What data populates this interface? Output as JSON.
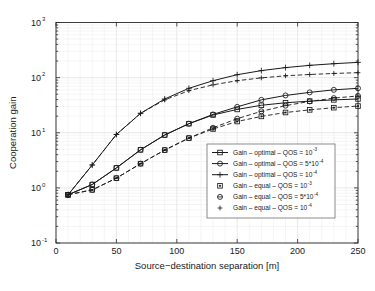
{
  "figure": {
    "background_color": "#ffffff",
    "line_color": "#1a1a1a",
    "grid_color": "#ebebeb"
  },
  "chart_data": {
    "type": "line",
    "title": "",
    "xlabel": "Source−destination separation [m]",
    "ylabel": "Cooperation gain",
    "xlim": [
      0,
      250
    ],
    "ylim": [
      0.1,
      1000
    ],
    "yscale": "log",
    "xscale": "linear",
    "grid": true,
    "xticks": [
      0,
      50,
      100,
      150,
      200,
      250
    ],
    "xticklabels": [
      "0",
      "50",
      "100",
      "150",
      "200",
      "250"
    ],
    "yticks": [
      0.1,
      1,
      10,
      100,
      1000
    ],
    "yticklabels": [
      "10^-1",
      "10^0",
      "10^1",
      "10^2",
      "10^3"
    ],
    "ytick_base": "10",
    "ytick_exponents": [
      "-1",
      "0",
      "1",
      "2",
      "3"
    ],
    "legend_position": "lower right",
    "x": [
      10,
      30,
      50,
      70,
      90,
      110,
      130,
      150,
      170,
      190,
      210,
      230,
      250
    ],
    "series": [
      {
        "name": "Gain - optimal - QOS = 10^-3",
        "label_main": "Gain – optimal – QOS = 10",
        "label_exp": "-3",
        "marker": "square",
        "linestyle": "solid",
        "values": [
          0.75,
          1.15,
          2.3,
          4.9,
          9.1,
          14.6,
          21.0,
          26.5,
          31.5,
          35.0,
          37.5,
          39.5,
          41.0
        ]
      },
      {
        "name": "Gain - optimal - QOS = 5*10^-4",
        "label_main": "Gain – optimal – QOS = 5*10",
        "label_exp": "-4",
        "marker": "circle",
        "linestyle": "solid",
        "values": [
          0.75,
          1.15,
          2.3,
          4.9,
          9.1,
          14.6,
          21.5,
          29.5,
          39.5,
          47.5,
          54.0,
          60.0,
          64.0
        ]
      },
      {
        "name": "Gain - optimal - QOS = 10^-4",
        "label_main": "Gain – optimal – QOS = 10",
        "label_exp": "-4",
        "marker": "plus",
        "linestyle": "solid",
        "values": [
          0.75,
          2.6,
          9.3,
          22.5,
          41.0,
          64.0,
          88.0,
          113.0,
          134.0,
          152.0,
          167.0,
          179.0,
          189.0
        ]
      },
      {
        "name": "Gain - equal - QOS = 10^-3",
        "label_main": "Gain – equal – QOS = 10",
        "label_exp": "-3",
        "marker": "square-filled",
        "linestyle": "dashed",
        "values": [
          0.75,
          0.92,
          1.5,
          2.75,
          4.85,
          8.0,
          11.7,
          16.0,
          19.8,
          23.3,
          26.0,
          28.5,
          30.5
        ]
      },
      {
        "name": "Gain - equal - QOS = 5*10^-4",
        "label_main": "Gain – equal – QOS = 5*10",
        "label_exp": "-4",
        "marker": "circle-filled",
        "linestyle": "dashed",
        "values": [
          0.75,
          0.92,
          1.5,
          2.75,
          4.85,
          8.0,
          12.3,
          18.0,
          24.5,
          31.0,
          37.0,
          42.5,
          46.5
        ]
      },
      {
        "name": "Gain - equal - QOS = 10^-4",
        "label_main": "Gain – equal – QOS = 10",
        "label_exp": "-4",
        "marker": "plus-small",
        "linestyle": "dashed",
        "values": [
          0.75,
          2.6,
          9.3,
          22.5,
          39.5,
          58.0,
          74.0,
          88.0,
          99.0,
          108.0,
          114.0,
          119.0,
          123.0
        ]
      }
    ]
  }
}
